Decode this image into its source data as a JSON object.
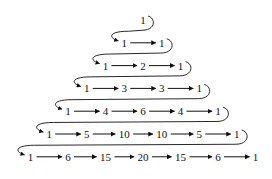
{
  "diagram": {
    "rows": [
      [
        "1"
      ],
      [
        "1",
        "1"
      ],
      [
        "1",
        "2",
        "1"
      ],
      [
        "1",
        "3",
        "3",
        "1"
      ],
      [
        "1",
        "4",
        "6",
        "4",
        "1"
      ],
      [
        "1",
        "5",
        "10",
        "10",
        "5",
        "1"
      ],
      [
        "1",
        "6",
        "15",
        "20",
        "15",
        "6",
        "1"
      ]
    ],
    "colors": {
      "ink": "#111111",
      "background": "#ffffff"
    }
  }
}
